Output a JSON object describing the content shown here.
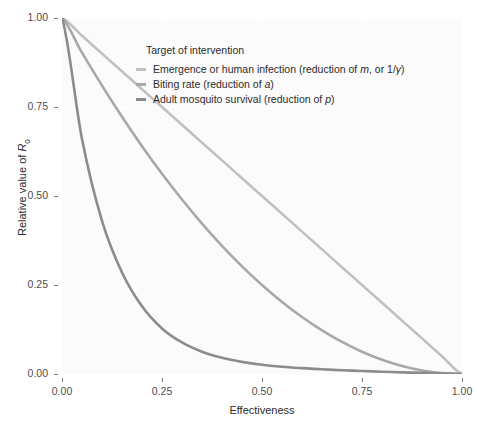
{
  "chart_data": {
    "type": "line",
    "title": "",
    "subtitle": "",
    "xlabel": "Effectiveness",
    "ylabel": "Relative value of R0",
    "ylabel_base": "Relative value of ",
    "ylabel_symbol": "R",
    "ylabel_subscript": "0",
    "xlim": [
      0,
      1
    ],
    "ylim": [
      0,
      1
    ],
    "xticks": [
      "0.00",
      "0.25",
      "0.50",
      "0.75",
      "1.00"
    ],
    "yticks": [
      "0.00",
      "0.25",
      "0.50",
      "0.75",
      "1.00"
    ],
    "xtick_values": [
      0,
      0.25,
      0.5,
      0.75,
      1
    ],
    "ytick_values": [
      0,
      0.25,
      0.5,
      0.75,
      1
    ],
    "grid": true,
    "grid_color": "#ffffff",
    "panel_background": "#fbfbfb",
    "legend_position": "inside-top-right",
    "legend_title": "Target of intervention",
    "x": [
      0,
      0.05,
      0.1,
      0.15,
      0.2,
      0.25,
      0.3,
      0.35,
      0.4,
      0.45,
      0.5,
      0.55,
      0.6,
      0.65,
      0.7,
      0.75,
      0.8,
      0.85,
      0.9,
      0.95,
      1
    ],
    "series": [
      {
        "name": "Emergence or human infection (reduction of m, or 1/γ)",
        "label_plain": "Emergence or human infection (reduction of ",
        "label_symbol1": "m",
        "label_mid": ", or 1/",
        "label_symbol2": "γ",
        "label_end": ")",
        "color": "#c0c0c0",
        "relationship": "linear",
        "values": [
          1,
          0.95,
          0.9,
          0.85,
          0.8,
          0.75,
          0.7,
          0.65,
          0.6,
          0.55,
          0.5,
          0.45,
          0.4,
          0.35,
          0.3,
          0.25,
          0.2,
          0.15,
          0.1,
          0.05,
          0
        ]
      },
      {
        "name": "Biting rate (reduction of a)",
        "label_plain": "Biting rate (reduction of ",
        "label_symbol1": "a",
        "label_mid": "",
        "label_symbol2": "",
        "label_end": ")",
        "color": "#a8a8a8",
        "relationship": "quadratic",
        "values": [
          1,
          0.9025,
          0.81,
          0.7225,
          0.64,
          0.5625,
          0.49,
          0.4225,
          0.36,
          0.3025,
          0.25,
          0.2025,
          0.16,
          0.1225,
          0.09,
          0.0625,
          0.04,
          0.0225,
          0.01,
          0.0025,
          0
        ]
      },
      {
        "name": "Adult mosquito survival (reduction of p)",
        "label_plain": "Adult mosquito survival (reduction of ",
        "label_symbol1": "p",
        "label_mid": "",
        "label_symbol2": "",
        "label_end": ")",
        "color": "#8c8c8c",
        "relationship": "steep-convex",
        "values": [
          1,
          0.66,
          0.43,
          0.285,
          0.19,
          0.128,
          0.0885,
          0.0625,
          0.0455,
          0.034,
          0.026,
          0.0205,
          0.0165,
          0.0132,
          0.0106,
          0.0084,
          0.0065,
          0.0047,
          0.0031,
          0.0015,
          0
        ]
      }
    ]
  }
}
